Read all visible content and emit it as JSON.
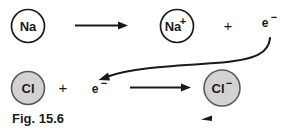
{
  "figure": {
    "caption": "Fig. 15.6",
    "background_color": "#ffffff",
    "stroke_color": "#1a1a1a",
    "atom_fill_color": "#ffffff",
    "ion_fill_color": "#d2d2d2"
  },
  "reaction_top": {
    "reactant_label": "Na",
    "arrow_name": "reaction-arrow",
    "product_label": "Na",
    "product_charge": "+",
    "plus_label": "+",
    "electron_label": "e",
    "electron_charge": "−"
  },
  "reaction_bottom": {
    "reactant_label": "Cl",
    "plus_label": "+",
    "electron_label": "e",
    "electron_charge": "−",
    "arrow_name": "reaction-arrow",
    "product_label": "Cl",
    "product_charge": "−"
  },
  "transfer": {
    "description": "electron-transfer-curved-arrow"
  }
}
